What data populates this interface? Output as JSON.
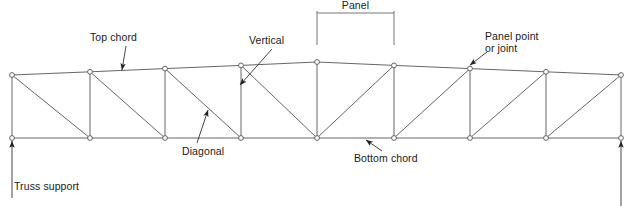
{
  "diagram": {
    "colors": {
      "member_stroke": "#555555",
      "node_stroke": "#555555",
      "node_fill": "#ffffff",
      "annotation_text": "#1a1a1a",
      "leader_stroke": "#333333",
      "background": "#ffffff"
    },
    "labels": {
      "top_chord": "Top chord",
      "vertical": "Vertical",
      "panel": "Panel",
      "panel_point_line1": "Panel point",
      "panel_point_line2": "or joint",
      "diagonal": "Diagonal",
      "bottom_chord": "Bottom chord",
      "truss_support": "Truss support"
    }
  },
  "chart_data": {
    "type": "diagram",
    "xlabel": "",
    "ylabel": "",
    "panel_count": 8,
    "joint_count": 18,
    "node_radius": 2.4,
    "top_chord_nodes": [
      {
        "id": "T0",
        "x": 12,
        "y": 75
      },
      {
        "id": "T1",
        "x": 90,
        "y": 71.8
      },
      {
        "id": "T2",
        "x": 165,
        "y": 68.6
      },
      {
        "id": "T3",
        "x": 241,
        "y": 65.4
      },
      {
        "id": "T4",
        "x": 317,
        "y": 62
      },
      {
        "id": "T5",
        "x": 394,
        "y": 65.4
      },
      {
        "id": "T6",
        "x": 470,
        "y": 68.6
      },
      {
        "id": "T7",
        "x": 546,
        "y": 71.8
      },
      {
        "id": "T8",
        "x": 621,
        "y": 75
      }
    ],
    "bottom_chord_nodes": [
      {
        "id": "B0",
        "x": 12,
        "y": 138
      },
      {
        "id": "B1",
        "x": 90,
        "y": 138
      },
      {
        "id": "B2",
        "x": 165,
        "y": 138
      },
      {
        "id": "B3",
        "x": 241,
        "y": 138
      },
      {
        "id": "B4",
        "x": 317,
        "y": 138
      },
      {
        "id": "B5",
        "x": 394,
        "y": 138
      },
      {
        "id": "B6",
        "x": 470,
        "y": 138
      },
      {
        "id": "B7",
        "x": 546,
        "y": 138
      },
      {
        "id": "B8",
        "x": 621,
        "y": 138
      }
    ],
    "verticals": [
      {
        "from": "T0",
        "to": "B0"
      },
      {
        "from": "T1",
        "to": "B1"
      },
      {
        "from": "T2",
        "to": "B2"
      },
      {
        "from": "T3",
        "to": "B3"
      },
      {
        "from": "T4",
        "to": "B4"
      },
      {
        "from": "T5",
        "to": "B5"
      },
      {
        "from": "T6",
        "to": "B6"
      },
      {
        "from": "T7",
        "to": "B7"
      },
      {
        "from": "T8",
        "to": "B8"
      }
    ],
    "diagonals": [
      {
        "from": "T0",
        "to": "B1"
      },
      {
        "from": "T1",
        "to": "B2"
      },
      {
        "from": "T2",
        "to": "B3"
      },
      {
        "from": "T3",
        "to": "B4"
      },
      {
        "from": "T5",
        "to": "B4"
      },
      {
        "from": "T6",
        "to": "B5"
      },
      {
        "from": "T7",
        "to": "B6"
      },
      {
        "from": "T8",
        "to": "B7"
      }
    ],
    "panel_dimension": {
      "x_start": 317,
      "x_end": 394,
      "y_line": 13,
      "tick_bottom": 45
    },
    "supports": [
      {
        "side": "left",
        "x": 12,
        "y": 138
      },
      {
        "side": "right",
        "x": 621,
        "y": 138
      }
    ],
    "annotations": [
      {
        "name": "top-chord",
        "text_x": 90,
        "text_y": 32,
        "arrow_from_x": 126,
        "arrow_from_y": 46,
        "arrow_to_x": 122,
        "arrow_to_y": 70
      },
      {
        "name": "vertical",
        "text_x": 249,
        "text_y": 35,
        "arrow_from_x": 272,
        "arrow_from_y": 49,
        "arrow_to_x": 240,
        "arrow_to_y": 85
      },
      {
        "name": "panel-point",
        "text_x": 485,
        "text_y": 31,
        "arrow_from_x": 487,
        "arrow_from_y": 52,
        "arrow_to_x": 470,
        "arrow_to_y": 65
      },
      {
        "name": "diagonal",
        "text_x": 182,
        "text_y": 146,
        "arrow_from_x": 197,
        "arrow_from_y": 143,
        "arrow_to_x": 208,
        "arrow_to_y": 110
      },
      {
        "name": "bottom-chord",
        "text_x": 354,
        "text_y": 153,
        "arrow_from_x": 382,
        "arrow_from_y": 151,
        "arrow_to_x": 366,
        "arrow_to_y": 140
      },
      {
        "name": "truss-support",
        "text_x": 14,
        "text_y": 181,
        "arrow_from_x": 12,
        "arrow_from_y": 198,
        "arrow_to_x": 12,
        "arrow_to_y": 141
      }
    ]
  }
}
